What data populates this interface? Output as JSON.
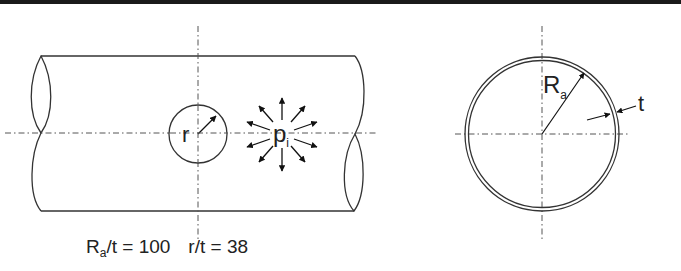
{
  "figure": {
    "type": "pipe cross-section schematic",
    "left_view": {
      "description": "Side view of cylindrical pipe with circular hole and internal pressure",
      "hole_label": "r",
      "pressure_label_main": "p",
      "pressure_label_sub": "i",
      "pressure_arrow_count": 12
    },
    "right_view": {
      "description": "Cross-section of thin-walled pipe",
      "radius_label_main": "R",
      "radius_label_sub": "a",
      "thickness_label": "t"
    },
    "caption": {
      "ratio1_main": "R",
      "ratio1_sub": "a",
      "ratio1_rest": "/t = 100",
      "ratio2": "r/t = 38"
    }
  },
  "colors": {
    "stroke": "#333333",
    "text": "#222222",
    "background": "#ffffff",
    "top_border": "#1a1a1a"
  }
}
